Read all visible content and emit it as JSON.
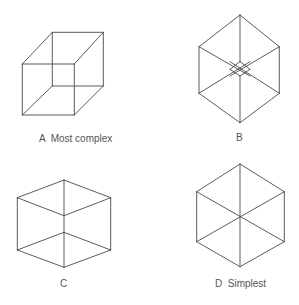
{
  "figures": [
    {
      "id": "A",
      "label": "A  Most complex",
      "description": "Necker cube, oblique projection (two offset squares)",
      "label_pos": [
        39,
        142
      ],
      "edges": [
        [
          22.3,
          64,
          74.3,
          64
        ],
        [
          74.3,
          64,
          74.3,
          115
        ],
        [
          74.3,
          115,
          22.3,
          115
        ],
        [
          22.3,
          115,
          22.3,
          64
        ],
        [
          52.3,
          32.3,
          103.3,
          32.3
        ],
        [
          103.3,
          32.3,
          103.3,
          86
        ],
        [
          103.3,
          86,
          52.3,
          86
        ],
        [
          52.3,
          86,
          52.3,
          32.3
        ],
        [
          22.3,
          64,
          52.3,
          32.3
        ],
        [
          74.3,
          64,
          103.3,
          32.3
        ],
        [
          74.3,
          115,
          103.3,
          86
        ],
        [
          22.3,
          115,
          52.3,
          86
        ]
      ]
    },
    {
      "id": "B",
      "label": "B",
      "description": "Cube viewed near corner-on, small inner diamond",
      "label_pos": [
        236,
        141
      ],
      "edges": [
        [
          240,
          15,
          279.3,
          46.7
        ],
        [
          279.3,
          46.7,
          279.3,
          93.3
        ],
        [
          279.3,
          93.3,
          240,
          122.7
        ],
        [
          240,
          122.7,
          199,
          93.3
        ],
        [
          199,
          93.3,
          199,
          46.7
        ],
        [
          199,
          46.7,
          240,
          15
        ],
        [
          240,
          15,
          240,
          61.7
        ],
        [
          240,
          76,
          240,
          122.7
        ],
        [
          199,
          46.7,
          250,
          76
        ],
        [
          279.3,
          46.7,
          230,
          76
        ],
        [
          199,
          93.3,
          250,
          61.7
        ],
        [
          279.3,
          93.3,
          230,
          61.7
        ],
        [
          240,
          61.7,
          250,
          69.3
        ],
        [
          250,
          69.3,
          240,
          76
        ],
        [
          240,
          76,
          230,
          69.3
        ],
        [
          230,
          69.3,
          240,
          61.7
        ]
      ]
    },
    {
      "id": "C",
      "label": "C",
      "description": "Cube with edges aligned, central vertical edge split",
      "label_pos": [
        60,
        287
      ],
      "edges": [
        [
          64,
          180,
          110.7,
          197.7
        ],
        [
          110.7,
          197.7,
          110.7,
          250
        ],
        [
          110.7,
          250,
          64,
          267.3
        ],
        [
          64,
          267.3,
          17.3,
          250
        ],
        [
          17.3,
          250,
          17.3,
          197.7
        ],
        [
          17.3,
          197.7,
          64,
          180
        ],
        [
          64,
          180,
          64,
          267.3
        ],
        [
          17.3,
          197.7,
          64,
          215.7
        ],
        [
          64,
          215.7,
          110.7,
          197.7
        ],
        [
          17.3,
          250,
          64,
          232.3
        ],
        [
          64,
          232.3,
          110.7,
          250
        ]
      ]
    },
    {
      "id": "D",
      "label": "D  Simplest",
      "description": "Regular hexagon with all three diagonals through center",
      "label_pos": [
        215,
        287
      ],
      "edges": [
        [
          240,
          164,
          284.3,
          191.7
        ],
        [
          284.3,
          191.7,
          284.3,
          241.7
        ],
        [
          284.3,
          241.7,
          240,
          266.7
        ],
        [
          240,
          266.7,
          196.7,
          241.7
        ],
        [
          196.7,
          241.7,
          196.7,
          191.7
        ],
        [
          196.7,
          191.7,
          240,
          164
        ],
        [
          240,
          164,
          240,
          266.7
        ],
        [
          196.7,
          191.7,
          284.3,
          241.7
        ],
        [
          284.3,
          191.7,
          196.7,
          241.7
        ]
      ]
    }
  ],
  "colors": {
    "stroke": "#4a4a4a",
    "label": "#555555",
    "background": "#ffffff"
  }
}
